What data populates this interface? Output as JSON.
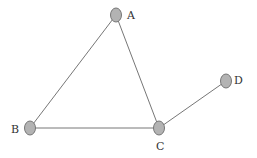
{
  "graph": {
    "nodes": [
      {
        "id": "A",
        "label": "A",
        "x": 116,
        "y": 15,
        "lx": 127,
        "ly": 19
      },
      {
        "id": "B",
        "label": "B",
        "x": 30,
        "y": 128,
        "lx": 11,
        "ly": 133
      },
      {
        "id": "C",
        "label": "C",
        "x": 159,
        "y": 128,
        "lx": 156,
        "ly": 150
      },
      {
        "id": "D",
        "label": "D",
        "x": 226,
        "y": 81,
        "lx": 234,
        "ly": 84
      }
    ],
    "edges": [
      {
        "from": "A",
        "to": "B"
      },
      {
        "from": "A",
        "to": "C"
      },
      {
        "from": "B",
        "to": "C"
      },
      {
        "from": "C",
        "to": "D"
      }
    ],
    "colors": {
      "node_fill": "#b3b3b3",
      "node_stroke": "#777777",
      "edge": "#555555"
    }
  }
}
